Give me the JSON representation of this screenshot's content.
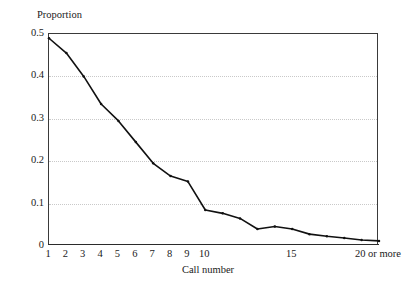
{
  "chart_data": {
    "type": "line",
    "title": "",
    "xlabel": "Call number",
    "ylabel": "Proportion",
    "categories": [
      "1",
      "2",
      "3",
      "4",
      "5",
      "6",
      "7",
      "8",
      "9",
      "10",
      "11",
      "12",
      "13",
      "14",
      "15",
      "16",
      "17",
      "18",
      "19",
      "20 or more"
    ],
    "values": [
      0.49,
      0.455,
      0.4,
      0.335,
      0.295,
      0.245,
      0.195,
      0.165,
      0.152,
      0.085,
      0.077,
      0.065,
      0.04,
      0.046,
      0.04,
      0.028,
      0.023,
      0.019,
      0.014,
      0.012
    ],
    "series": [
      {
        "name": "Proportion",
        "values": [
          0.49,
          0.455,
          0.4,
          0.335,
          0.295,
          0.245,
          0.195,
          0.165,
          0.152,
          0.085,
          0.077,
          0.065,
          0.04,
          0.046,
          0.04,
          0.028,
          0.023,
          0.019,
          0.014,
          0.012
        ]
      }
    ],
    "ylim": [
      0,
      0.5
    ],
    "yticks": [
      0,
      0.1,
      0.2,
      0.3,
      0.4,
      0.5
    ],
    "ytick_labels": [
      "0",
      "0.1",
      "0.2",
      "0.3",
      "0.4",
      "0.5"
    ],
    "xtick_labels": [
      {
        "category": "1",
        "label": "1"
      },
      {
        "category": "2",
        "label": "2"
      },
      {
        "category": "3",
        "label": "3"
      },
      {
        "category": "4",
        "label": "4"
      },
      {
        "category": "5",
        "label": "5"
      },
      {
        "category": "6",
        "label": "6"
      },
      {
        "category": "7",
        "label": "7"
      },
      {
        "category": "8",
        "label": "8"
      },
      {
        "category": "9",
        "label": "9"
      },
      {
        "category": "10",
        "label": "10"
      },
      {
        "category": "15",
        "label": "15"
      },
      {
        "category": "20 or more",
        "label": "20 or more"
      }
    ],
    "grid": "horizontal-dotted",
    "gridline_values": [
      0.1,
      0.2,
      0.3,
      0.4
    ],
    "legend": "none",
    "line_color": "#111111",
    "grid_color": "#c9c9c9",
    "axis_color": "#3a3a3a",
    "marker": "small-dot"
  }
}
